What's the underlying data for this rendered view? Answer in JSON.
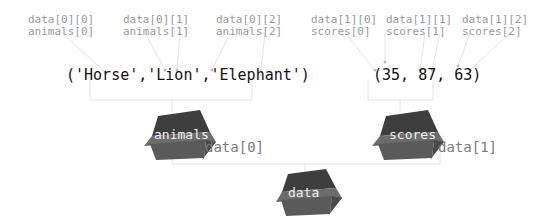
{
  "tuples": {
    "animals": {
      "text": "('Horse','Lion','Elephant')",
      "items": [
        {
          "value": "'Horse'",
          "index_data": "data[0][0]",
          "index_name": "animals[0]"
        },
        {
          "value": "'Lion'",
          "index_data": "data[0][1]",
          "index_name": "animals[1]"
        },
        {
          "value": "'Elephant'",
          "index_data": "data[0][2]",
          "index_name": "animals[2]"
        }
      ]
    },
    "scores": {
      "text": "(35, 87, 63)",
      "items": [
        {
          "value": "35",
          "index_data": "data[1][0]",
          "index_name": "scores[0]"
        },
        {
          "value": "87",
          "index_data": "data[1][1]",
          "index_name": "scores[1]"
        },
        {
          "value": "63",
          "index_data": "data[1][2]",
          "index_name": "scores[2]"
        }
      ]
    }
  },
  "boxes": {
    "animals": {
      "label": "animals",
      "ref": "data[0]"
    },
    "scores": {
      "label": "scores",
      "ref": "data[1]"
    },
    "data": {
      "label": "data"
    }
  },
  "colors": {
    "box_dark": "#3e3e3e",
    "box_mid": "#5e5e5e",
    "box_light": "#707070",
    "index_text": "#9a9a9a",
    "connector": "#e6e6e6"
  }
}
